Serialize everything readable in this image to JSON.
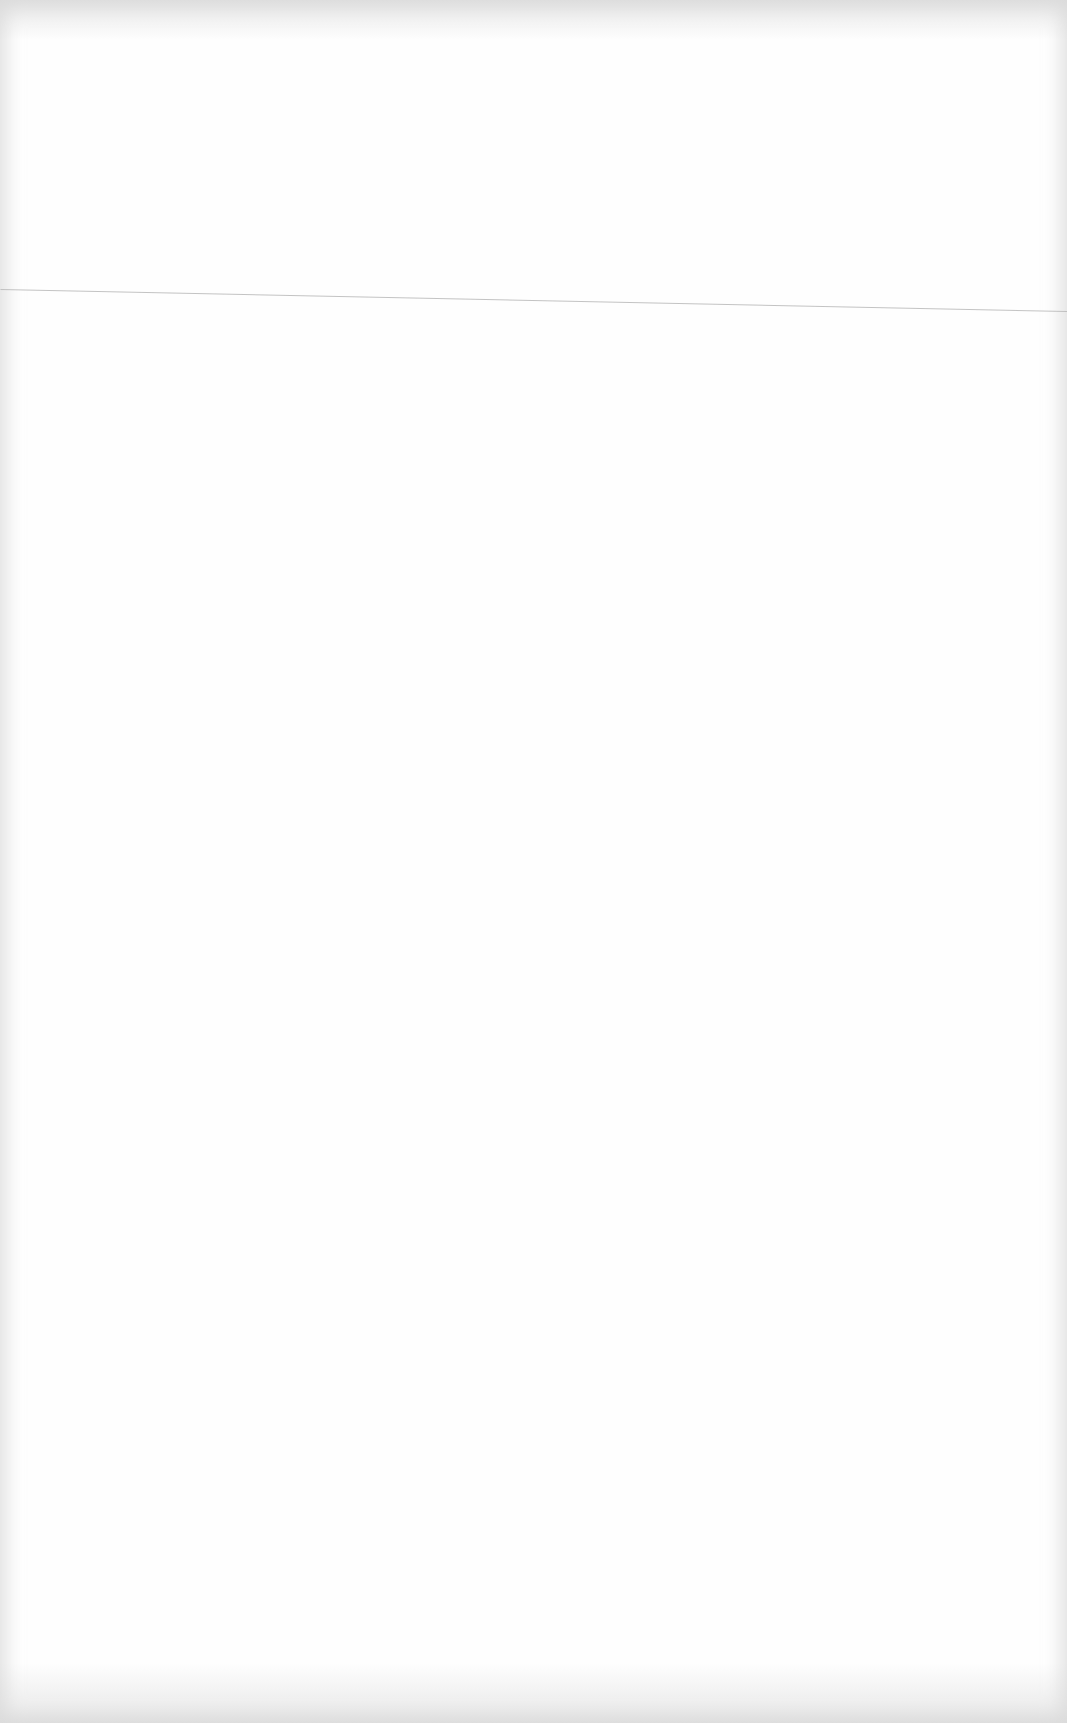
{
  "document": {
    "type": "blank-scanned-page",
    "text_content": "",
    "background_color": "#fefefe",
    "edge_shade_color": "#d7d7d7",
    "rule_line": {
      "color": "#b8b8b8",
      "start_y": 289,
      "end_y": 312
    }
  }
}
